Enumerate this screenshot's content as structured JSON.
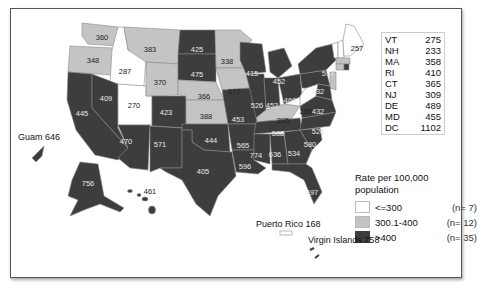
{
  "legend": {
    "title_line1": "Rate per 100,000",
    "title_line2": "population",
    "items": [
      {
        "range": "<=300",
        "count": "(n=  7)",
        "color": "#ffffff"
      },
      {
        "range": "300.1-400",
        "count": "(n= 12)",
        "color": "#c4c4c4"
      },
      {
        "range": ">400",
        "count": "(n= 35)",
        "color": "#3d3d3d"
      }
    ]
  },
  "small_states": [
    {
      "abbr": "VT",
      "value": "275"
    },
    {
      "abbr": "NH",
      "value": "233"
    },
    {
      "abbr": "MA",
      "value": "358"
    },
    {
      "abbr": "RI",
      "value": "410"
    },
    {
      "abbr": "CT",
      "value": "365"
    },
    {
      "abbr": "NJ",
      "value": "309"
    },
    {
      "abbr": "DE",
      "value": "489"
    },
    {
      "abbr": "MD",
      "value": "455"
    },
    {
      "abbr": "DC",
      "value": "1102"
    }
  ],
  "territories": {
    "guam": "Guam 646",
    "puerto_rico": "Puerto Rico 168",
    "virgin_islands": "Virgin Islands 758"
  },
  "colors": {
    "low": "#ffffff",
    "mid": "#c4c4c4",
    "high": "#3d3d3d",
    "border": "#888888"
  },
  "state_values": {
    "WA": "360",
    "OR": "348",
    "ID": "287",
    "MT": "383",
    "WY": "370",
    "NV": "409",
    "UT": "270",
    "CA": "445",
    "AZ": "470",
    "NM": "571",
    "CO": "423",
    "ND": "425",
    "SD": "475",
    "NE": "366",
    "KS": "388",
    "OK": "444",
    "TX": "405",
    "MN": "338",
    "IA": "372",
    "MO": "453",
    "AR": "565",
    "LA": "596",
    "WI": "415",
    "IL": "526",
    "MI": "452",
    "IN": "453",
    "OH": "460",
    "KY": "395",
    "TN": "508",
    "MS": "774",
    "AL": "636",
    "GA": "534",
    "FL": "497",
    "SC": "580",
    "NC": "524",
    "VA": "432",
    "WV": "258",
    "PA": "432",
    "NY": "517",
    "ME": "257",
    "AK": "756",
    "HI": "461"
  }
}
